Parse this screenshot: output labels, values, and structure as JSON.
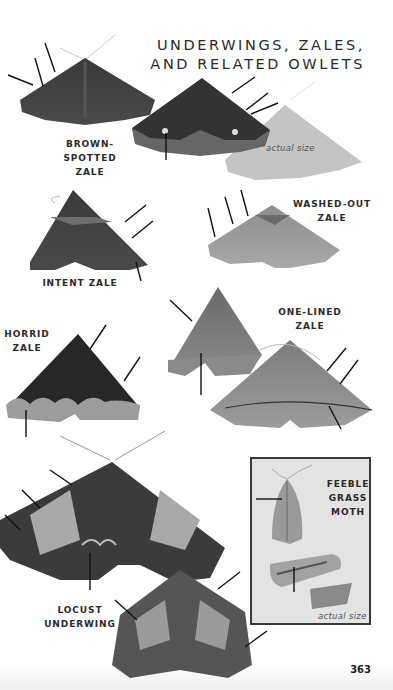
{
  "page": {
    "title_line1": "UNDERWINGS, ZALES,",
    "title_line2": "AND RELATED OWLETS",
    "page_number": "363"
  },
  "species": [
    {
      "id": "brown-spotted-zale",
      "label_line1": "BROWN-SPOTTED",
      "label_line2": "ZALE",
      "actual_size_label": "actual size"
    },
    {
      "id": "intent-zale",
      "label_line1": "INTENT ZALE"
    },
    {
      "id": "washed-out-zale",
      "label_line1": "WASHED-OUT",
      "label_line2": "ZALE"
    },
    {
      "id": "horrid-zale",
      "label_line1": "HORRID",
      "label_line2": "ZALE"
    },
    {
      "id": "one-lined-zale",
      "label_line1": "ONE-LINED",
      "label_line2": "ZALE"
    },
    {
      "id": "locust-underwing",
      "label_line1": "LOCUST",
      "label_line2": "UNDERWING"
    },
    {
      "id": "feeble-grass-moth",
      "label_line1": "FEEBLE",
      "label_line2": "GRASS",
      "label_line3": "MOTH",
      "actual_size_label": "actual size"
    }
  ],
  "colors": {
    "background": "#ffffff",
    "text": "#2b2b2b",
    "inset_background": "#e3e3e3",
    "inset_border": "#3a3a3a",
    "silhouette": "#c4c4c4"
  }
}
